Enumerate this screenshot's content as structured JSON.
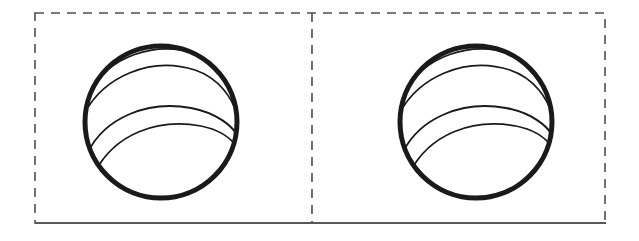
{
  "figure": {
    "background_color": "#ffffff",
    "width": 639,
    "height": 241,
    "stroke_color": "#1a1a1a",
    "dash_color": "#4d4d4d",
    "baseline_color": "#595959"
  },
  "layout": {
    "dashed_frame": {
      "x": 35,
      "y": 13,
      "width": 570,
      "height": 210,
      "dash_pattern": "9 7",
      "stroke_width": 1.6
    },
    "divider": {
      "x": 312,
      "y_top": 13,
      "y_bottom": 223,
      "dash_pattern": "9 7",
      "stroke_width": 1.6
    },
    "baseline": {
      "x_start": 35,
      "x_end": 606,
      "y": 223,
      "stroke_width": 1.8
    }
  },
  "panels": [
    {
      "name": "left-panel",
      "label": "Left sphere panel",
      "sphere": {
        "center_x": 161,
        "center_y": 122,
        "radius": 78,
        "outline_stroke_width": 5.0,
        "band_stroke_width": 1.7,
        "band_count": 4
      }
    },
    {
      "name": "right-panel",
      "label": "Right sphere panel",
      "sphere": {
        "center_x": 476,
        "center_y": 122,
        "radius": 78,
        "outline_stroke_width": 5.0,
        "band_stroke_width": 1.7,
        "band_count": 4
      }
    }
  ],
  "sphere_bands": [
    {
      "index": 0,
      "description": "upper band arc, concave down, spanning upper-left to upper-right",
      "path": "M -73,-28 C -52,-66 -6,-82 36,-68 C 58,-60 70,-44 76,-24"
    },
    {
      "index": 1,
      "description": "upper-mid band arc sweeping from left rim toward right rim",
      "path": "M -78,-6 C -58,-46 -10,-66 34,-52 C 58,-44 72,-24 78,-2"
    },
    {
      "index": 2,
      "description": "equatorial band arc crossing the middle of the sphere",
      "path": "M -73,30 C -56,-4 -14,-22 30,-14 C 56,-9 72,4 78,16"
    },
    {
      "index": 3,
      "description": "lower band arc, concave up, lower-left to right rim",
      "path": "M -66,50 C -46,12 -4,-4 40,4 C 60,8 72,18 78,28"
    }
  ]
}
